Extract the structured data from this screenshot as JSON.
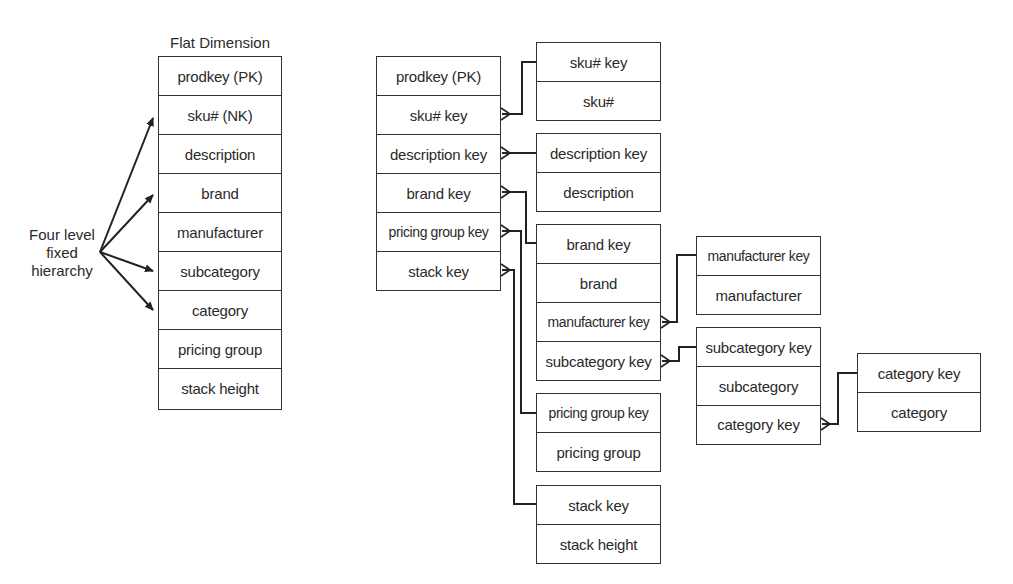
{
  "flat_dimension": {
    "title": "Flat Dimension",
    "rows": [
      "prodkey (PK)",
      "sku# (NK)",
      "description",
      "brand",
      "manufacturer",
      "subcategory",
      "category",
      "pricing group",
      "stack height"
    ]
  },
  "annotation": {
    "line1": "Four level",
    "line2": "fixed",
    "line3": "hierarchy"
  },
  "snowflake": {
    "product": {
      "rows": [
        "prodkey (PK)",
        "sku# key",
        "description key",
        "brand key",
        "pricing group key",
        "stack key"
      ]
    },
    "sku": {
      "rows": [
        "sku# key",
        "sku#"
      ]
    },
    "description": {
      "rows": [
        "description key",
        "description"
      ]
    },
    "brand": {
      "rows": [
        "brand key",
        "brand",
        "manufacturer key",
        "subcategory key"
      ]
    },
    "pricing_group": {
      "rows": [
        "pricing group key",
        "pricing group"
      ]
    },
    "stack": {
      "rows": [
        "stack key",
        "stack height"
      ]
    },
    "manufacturer": {
      "rows": [
        "manufacturer key",
        "manufacturer"
      ]
    },
    "subcategory": {
      "rows": [
        "subcategory key",
        "subcategory",
        "category key"
      ]
    },
    "category": {
      "rows": [
        "category key",
        "category"
      ]
    }
  },
  "colors": {
    "line": "#333333",
    "text": "#2a2a2a",
    "background": "#ffffff"
  }
}
